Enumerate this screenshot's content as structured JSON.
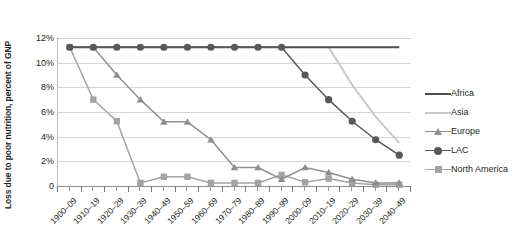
{
  "chart_data": {
    "type": "line",
    "title": "",
    "xlabel": "",
    "ylabel": "Loss due to poor nutrition, percent of GNP",
    "categories": [
      "1900–09",
      "1910–19",
      "1920–29",
      "1930–39",
      "1940–49",
      "1950–59",
      "1960–69",
      "1970–79",
      "1980–89",
      "1990–99",
      "2000–09",
      "2010–19",
      "2020–29",
      "2030–39",
      "2040–49"
    ],
    "ylim": [
      0,
      12
    ],
    "ytick_labels": [
      "0",
      "2%",
      "4%",
      "6%",
      "8%",
      "10%",
      "12%"
    ],
    "ytick_values": [
      0,
      2,
      4,
      6,
      8,
      10,
      12
    ],
    "grid": true,
    "legend_position": "right",
    "series": [
      {
        "name": "Africa",
        "color": "#4d4d4d",
        "marker": "none",
        "values": [
          11.25,
          11.25,
          11.25,
          11.25,
          11.25,
          11.25,
          11.25,
          11.25,
          11.25,
          11.25,
          11.25,
          11.25,
          11.25,
          11.25,
          11.25
        ]
      },
      {
        "name": "Asia",
        "color": "#c9c9c9",
        "marker": "none",
        "values": [
          null,
          null,
          null,
          null,
          null,
          null,
          null,
          null,
          null,
          null,
          null,
          11.25,
          8.2,
          5.6,
          3.5
        ]
      },
      {
        "name": "Europe",
        "color": "#8f8f8f",
        "marker": "triangle",
        "values": [
          null,
          11.25,
          9.0,
          7.0,
          5.2,
          5.2,
          3.75,
          1.5,
          1.5,
          0.55,
          1.5,
          1.1,
          0.55,
          0.25,
          0.25
        ]
      },
      {
        "name": "LAC",
        "color": "#585858",
        "marker": "circle",
        "values": [
          11.25,
          11.25,
          11.25,
          11.25,
          11.25,
          11.25,
          11.25,
          11.25,
          11.25,
          11.25,
          9.0,
          7.0,
          5.25,
          3.75,
          2.5
        ]
      },
      {
        "name": "North America",
        "color": "#a3a3a3",
        "marker": "square",
        "values": [
          11.25,
          7.0,
          5.25,
          0.25,
          0.75,
          0.75,
          0.25,
          0.25,
          0.25,
          0.9,
          0.3,
          0.6,
          0.25,
          0.1,
          0.1
        ]
      }
    ]
  },
  "legend": {
    "items": [
      {
        "label": "Africa"
      },
      {
        "label": "Asia"
      },
      {
        "label": "Europe"
      },
      {
        "label": "LAC"
      },
      {
        "label": "North America"
      }
    ]
  }
}
